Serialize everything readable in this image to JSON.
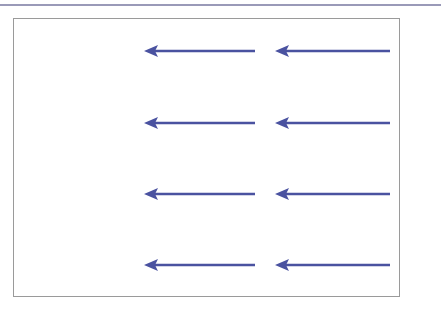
{
  "diagram": {
    "arrow_color": "#4a52a0",
    "frame_color": "#9a9a9a",
    "rule_color": "#9a9ab8",
    "rows": [
      {
        "y": 51,
        "arrows": [
          {
            "x1": 255,
            "x2": 144
          },
          {
            "x1": 390,
            "x2": 275
          }
        ]
      },
      {
        "y": 123,
        "arrows": [
          {
            "x1": 255,
            "x2": 144
          },
          {
            "x1": 390,
            "x2": 275
          }
        ]
      },
      {
        "y": 194,
        "arrows": [
          {
            "x1": 255,
            "x2": 144
          },
          {
            "x1": 390,
            "x2": 275
          }
        ]
      },
      {
        "y": 265,
        "arrows": [
          {
            "x1": 255,
            "x2": 144
          },
          {
            "x1": 390,
            "x2": 275
          }
        ]
      }
    ],
    "direction": "left"
  }
}
